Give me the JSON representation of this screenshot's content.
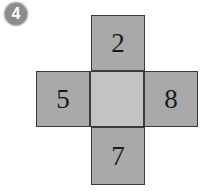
{
  "badge": {
    "label": "4"
  },
  "net": {
    "cells": {
      "top": {
        "label": "2"
      },
      "left": {
        "label": "5"
      },
      "center": {
        "label": ""
      },
      "right": {
        "label": "8"
      },
      "bottom": {
        "label": "7"
      }
    },
    "colors": {
      "face": "#a9a9a9",
      "center": "#c3c3c3",
      "border": "#3a3a3a"
    }
  }
}
